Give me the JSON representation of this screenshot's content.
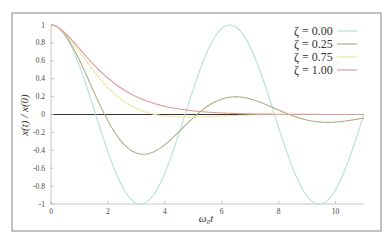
{
  "chart_data": {
    "type": "line",
    "title": "",
    "xlabel": "ω₀t",
    "ylabel": "x(t) / x(0)",
    "xlim": [
      0,
      11
    ],
    "ylim": [
      -1,
      1
    ],
    "xticks": [
      0,
      2,
      4,
      6,
      8,
      10
    ],
    "xtick_labels": [
      "0",
      "2",
      "4",
      "6",
      "8",
      "10"
    ],
    "yticks": [
      -1,
      -0.8,
      -0.6,
      -0.4,
      -0.2,
      0,
      0.2,
      0.4,
      0.6,
      0.8,
      1
    ],
    "ytick_labels": [
      "-1",
      "-0.8",
      "-0.6",
      "-0.4",
      "-0.2",
      "0",
      "0.2",
      "0.4",
      "0.6",
      "0.8",
      "1"
    ],
    "grid": false,
    "legend_position": "top-right",
    "zero_line": true,
    "series": [
      {
        "name": "ζ = 0.00",
        "zeta": 0.0,
        "color": "#b4e0dc"
      },
      {
        "name": "ζ = 0.25",
        "zeta": 0.25,
        "color": "#b0ae84"
      },
      {
        "name": "ζ = 0.75",
        "zeta": 0.75,
        "color": "#ece7a0"
      },
      {
        "name": "ζ = 1.00",
        "zeta": 1.0,
        "color": "#df9a9a"
      }
    ],
    "sample_points": {
      "x": [
        0,
        1,
        2,
        3,
        4,
        5,
        6,
        7,
        8,
        9,
        10,
        11
      ],
      "zeta_0.00": [
        1,
        0.54,
        -0.42,
        -0.99,
        -0.65,
        0.28,
        0.96,
        0.75,
        -0.15,
        -0.91,
        -0.84,
        0.0
      ],
      "zeta_0.25": [
        1,
        0.63,
        -0.07,
        -0.43,
        -0.36,
        -0.06,
        0.16,
        0.17,
        0.05,
        -0.06,
        -0.08,
        -0.04
      ],
      "zeta_0.75": [
        1,
        0.74,
        0.37,
        0.12,
        0.01,
        -0.02,
        -0.02,
        -0.01,
        0.0,
        0.0,
        0.0,
        0.0
      ],
      "zeta_1.00": [
        1,
        0.74,
        0.41,
        0.2,
        0.09,
        0.04,
        0.02,
        0.01,
        0.0,
        0.0,
        0.0,
        0.0
      ]
    }
  }
}
